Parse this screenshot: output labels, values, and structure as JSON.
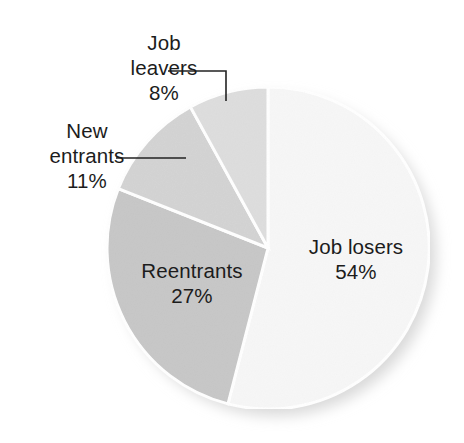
{
  "chart_data": {
    "type": "pie",
    "title": "",
    "subtitle": "",
    "xlabel": "",
    "ylabel": "",
    "units": "percent",
    "legend_position": "none",
    "grid": false,
    "label_format": "name + percent",
    "start_angle_deg": 0,
    "direction": "clockwise",
    "categories": [
      "Job losers",
      "Reentrants",
      "New entrants",
      "Job leavers"
    ],
    "values": [
      54,
      27,
      11,
      8
    ],
    "total": 100,
    "slices": [
      {
        "name": "Job losers",
        "value": 54,
        "value_text": "54%",
        "color": "#f7f7f7",
        "label_placement": "inside",
        "leader_line": false
      },
      {
        "name": "Reentrants",
        "value": 27,
        "value_text": "27%",
        "color": "#c8c8c8",
        "label_placement": "inside",
        "leader_line": false
      },
      {
        "name": "New entrants",
        "value": 11,
        "value_text": "11%",
        "color": "#d4d4d4",
        "label_placement": "outside",
        "leader_line": true
      },
      {
        "name": "Job leavers",
        "value": 8,
        "value_text": "8%",
        "color": "#dedede",
        "label_placement": "outside",
        "leader_line": true
      }
    ]
  },
  "labels": {
    "job_losers": {
      "name": "Job losers",
      "value": "54%"
    },
    "reentrants": {
      "name": "Reentrants",
      "value": "27%"
    },
    "new_entrants_line1": "New",
    "new_entrants_line2": "entrants",
    "new_entrants_value": "11%",
    "job_leavers_line1": "Job",
    "job_leavers_line2": "leavers",
    "job_leavers_value": "8%"
  },
  "style": {
    "background": "#ffffff",
    "separator_color": "#ffffff",
    "text_color": "#1c1c1c",
    "leader_line_color": "#222222",
    "shadow_color": "#d8d8d8"
  }
}
